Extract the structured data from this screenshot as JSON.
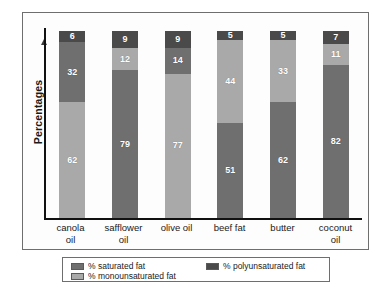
{
  "chart_data": {
    "type": "bar",
    "subtype": "stacked-bar-100",
    "title": "",
    "xlabel": "",
    "ylabel": "Percentages",
    "ylim": [
      0,
      100
    ],
    "grid": false,
    "legend_position": "bottom",
    "categories": [
      "canola oil",
      "safflower oil",
      "olive oil",
      "beef fat",
      "butter",
      "coconut oil"
    ],
    "series": [
      {
        "name": "% saturated fat",
        "key": "sat",
        "color": "#6f6f6f",
        "values": [
          6,
          9,
          9,
          51,
          62,
          82
        ]
      },
      {
        "name": "% monounsaturated fat",
        "key": "mono",
        "color": "#a9a9a9",
        "values": [
          62,
          12,
          77,
          44,
          33,
          11
        ]
      },
      {
        "name": "% polyunsaturated fat",
        "key": "poly",
        "color": "#4a4a4a",
        "values": [
          32,
          79,
          14,
          5,
          5,
          7
        ]
      }
    ],
    "stacks": [
      {
        "category": "canola oil",
        "segments": [
          {
            "key": "poly",
            "value": 6
          },
          {
            "key": "sat",
            "value": 32
          },
          {
            "key": "mono",
            "value": 62
          }
        ]
      },
      {
        "category": "safflower oil",
        "segments": [
          {
            "key": "poly",
            "value": 9
          },
          {
            "key": "mono",
            "value": 12
          },
          {
            "key": "sat",
            "value": 79
          }
        ]
      },
      {
        "category": "olive oil",
        "segments": [
          {
            "key": "poly",
            "value": 9
          },
          {
            "key": "sat",
            "value": 14
          },
          {
            "key": "mono",
            "value": 77
          }
        ]
      },
      {
        "category": "beef fat",
        "segments": [
          {
            "key": "poly",
            "value": 5
          },
          {
            "key": "mono",
            "value": 44
          },
          {
            "key": "sat",
            "value": 51
          }
        ]
      },
      {
        "category": "butter",
        "segments": [
          {
            "key": "poly",
            "value": 5
          },
          {
            "key": "mono",
            "value": 33
          },
          {
            "key": "sat",
            "value": 62
          }
        ]
      },
      {
        "category": "coconut oil",
        "segments": [
          {
            "key": "poly",
            "value": 7
          },
          {
            "key": "mono",
            "value": 11
          },
          {
            "key": "sat",
            "value": 82
          }
        ]
      }
    ]
  },
  "axis": {
    "y_title": "Percentages",
    "arrow_direction": "up"
  },
  "xlabels": [
    {
      "line1": "canola",
      "line2": "oil"
    },
    {
      "line1": "safflower",
      "line2": "oil"
    },
    {
      "line1": "olive oil",
      "line2": ""
    },
    {
      "line1": "beef fat",
      "line2": ""
    },
    {
      "line1": "butter",
      "line2": ""
    },
    {
      "line1": "coconut",
      "line2": "oil"
    }
  ],
  "legend": {
    "items": [
      {
        "label": "% saturated fat",
        "key": "sat",
        "color": "#6f6f6f"
      },
      {
        "label": "% monounsaturated fat",
        "key": "mono",
        "color": "#a9a9a9"
      },
      {
        "label": "% polyunsaturated fat",
        "key": "poly",
        "color": "#4a4a4a"
      }
    ]
  },
  "colors": {
    "saturated": "#6f6f6f",
    "monounsaturated": "#a9a9a9",
    "polyunsaturated": "#4a4a4a",
    "frame": "#6e6e6e",
    "axis": "#111111",
    "background": "#ffffff",
    "plot_background": "#fdfdfd",
    "label_text": "#ffffff"
  }
}
